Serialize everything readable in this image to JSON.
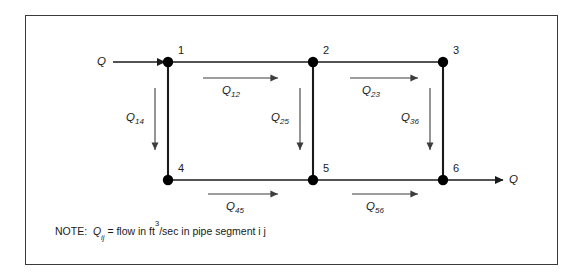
{
  "figure": {
    "type": "pipe-network-flow-diagram",
    "frame_color": "#3a3a3a",
    "line_color": "#1a1a1a",
    "node_color": "#000000",
    "arrow_color": "#4a4a4a"
  },
  "nodes": [
    {
      "id": "1",
      "label": "1",
      "x": 168,
      "y": 62
    },
    {
      "id": "2",
      "label": "2",
      "x": 313,
      "y": 62
    },
    {
      "id": "3",
      "label": "3",
      "x": 443,
      "y": 62
    },
    {
      "id": "4",
      "label": "4",
      "x": 168,
      "y": 180
    },
    {
      "id": "5",
      "label": "5",
      "x": 313,
      "y": 180
    },
    {
      "id": "6",
      "label": "6",
      "x": 443,
      "y": 180
    }
  ],
  "flows": [
    {
      "id": "Q12",
      "sym": "Q",
      "sub": "12",
      "from": "1",
      "to": "2",
      "dir": "right"
    },
    {
      "id": "Q23",
      "sym": "Q",
      "sub": "23",
      "from": "2",
      "to": "3",
      "dir": "right"
    },
    {
      "id": "Q14",
      "sym": "Q",
      "sub": "14",
      "from": "1",
      "to": "4",
      "dir": "down"
    },
    {
      "id": "Q25",
      "sym": "Q",
      "sub": "25",
      "from": "2",
      "to": "5",
      "dir": "down"
    },
    {
      "id": "Q36",
      "sym": "Q",
      "sub": "36",
      "from": "3",
      "to": "6",
      "dir": "down"
    },
    {
      "id": "Q45",
      "sym": "Q",
      "sub": "45",
      "from": "4",
      "to": "5",
      "dir": "right"
    },
    {
      "id": "Q56",
      "sym": "Q",
      "sub": "56",
      "from": "5",
      "to": "6",
      "dir": "right"
    }
  ],
  "external": {
    "inlet_label": "Q",
    "outlet_label": "Q"
  },
  "note": {
    "head": "NOTE:",
    "symbol": "Q",
    "subscript": "ij",
    "equals": "= flow in ft",
    "exponent": "3",
    "tail": "/sec in pipe segment i j"
  }
}
